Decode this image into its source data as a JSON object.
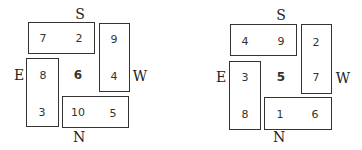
{
  "diagrams": [
    {
      "directions": {
        "top": "S",
        "bottom": "N",
        "left": "E",
        "right": "W"
      },
      "center": "6",
      "top_box": [
        "7",
        "2"
      ],
      "right_box": [
        "9",
        "4"
      ],
      "left_box": [
        "8",
        "3"
      ],
      "bottom_box": [
        "10",
        "5"
      ]
    },
    {
      "directions": {
        "top": "S",
        "bottom": "N",
        "left": "E",
        "right": "W"
      },
      "center": "5",
      "top_box": [
        "4",
        "9"
      ],
      "right_box": [
        "2",
        "7"
      ],
      "left_box": [
        "3",
        "8"
      ],
      "bottom_box": [
        "1",
        "6"
      ]
    }
  ]
}
